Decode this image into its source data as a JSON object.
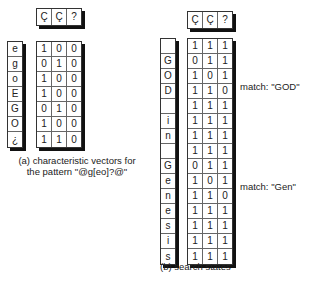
{
  "header_symbols": [
    "Ç",
    "Ç",
    "?"
  ],
  "panel_a": {
    "labels": [
      "e",
      "g",
      "o",
      "E",
      "G",
      "O",
      "¿"
    ],
    "vectors": [
      [
        "1",
        "0",
        "0"
      ],
      [
        "0",
        "1",
        "0"
      ],
      [
        "1",
        "0",
        "0"
      ],
      [
        "1",
        "0",
        "0"
      ],
      [
        "0",
        "1",
        "0"
      ],
      [
        "1",
        "0",
        "0"
      ],
      [
        "1",
        "1",
        "0"
      ]
    ],
    "caption_line1": "(a) characteristic vectors for",
    "caption_line2": "the pattern \"@g[eo]?@\""
  },
  "panel_b": {
    "labels": [
      "",
      "G",
      "O",
      "D",
      "",
      "i",
      "n",
      "",
      "G",
      "e",
      "n",
      "e",
      "s",
      "i",
      "s"
    ],
    "states": [
      [
        "1",
        "1",
        "1"
      ],
      [
        "0",
        "1",
        "1"
      ],
      [
        "1",
        "0",
        "1"
      ],
      [
        "1",
        "1",
        "0"
      ],
      [
        "1",
        "1",
        "1"
      ],
      [
        "1",
        "1",
        "1"
      ],
      [
        "1",
        "1",
        "1"
      ],
      [
        "1",
        "1",
        "1"
      ],
      [
        "0",
        "1",
        "1"
      ],
      [
        "1",
        "0",
        "1"
      ],
      [
        "1",
        "1",
        "0"
      ],
      [
        "1",
        "1",
        "1"
      ],
      [
        "1",
        "1",
        "1"
      ],
      [
        "1",
        "1",
        "1"
      ],
      [
        "1",
        "1",
        "1"
      ]
    ],
    "match_god": "match: \"GOD\"",
    "match_gen": "match: \"Gen\"",
    "caption": "(b) search states"
  }
}
